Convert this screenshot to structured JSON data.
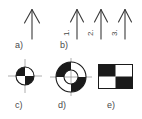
{
  "figure": {
    "background_color": "#ffffff",
    "ink_color": "#3a3a3a",
    "fill_black": "#1a1a1a",
    "fill_white": "#ffffff",
    "panels": [
      {
        "id": "a",
        "label": "a)",
        "type": "arrow-single",
        "description": "single vertical arrow pointing up",
        "arrows": [
          {
            "name": "",
            "direction": "up"
          }
        ]
      },
      {
        "id": "b",
        "label": "b)",
        "type": "arrow-group",
        "description": "three vertical arrows pointing up, numbered 1. 2. 3.",
        "arrows": [
          {
            "name": "1.",
            "direction": "up"
          },
          {
            "name": "2.",
            "direction": "up"
          },
          {
            "name": "3.",
            "direction": "up"
          }
        ]
      },
      {
        "id": "c",
        "label": "c)",
        "type": "checker-disc",
        "description": "small disc split into four alternating black and white quadrants with crosshair axes",
        "quadrants": [
          "black",
          "white",
          "white",
          "black"
        ],
        "crosshair": true
      },
      {
        "id": "d",
        "label": "d)",
        "type": "checker-annulus",
        "description": "annulus split into four alternating black and white quadrants with crosshair axes",
        "quadrants": [
          "black",
          "white",
          "white",
          "black"
        ],
        "crosshair": true
      },
      {
        "id": "e",
        "label": "e)",
        "type": "checker-rect",
        "description": "rectangle with 2x2 checkerboard of black and white squares",
        "cells": [
          [
            "black",
            "white"
          ],
          [
            "white",
            "black"
          ]
        ]
      }
    ]
  }
}
